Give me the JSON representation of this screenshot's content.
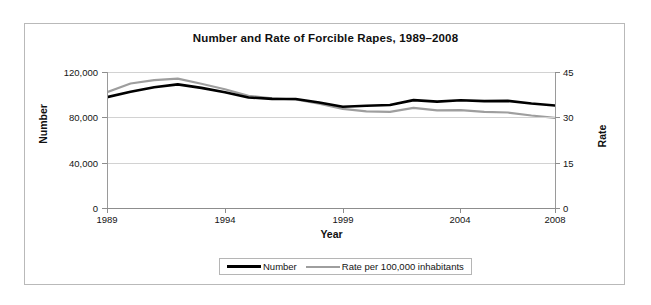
{
  "chart_data": {
    "type": "line",
    "title": "Number and Rate of Forcible Rapes, 1989–2008",
    "xlabel": "Year",
    "ylabel": "Number",
    "y2label": "Rate",
    "grid": true,
    "legend_position": "bottom",
    "x": [
      1989,
      1990,
      1991,
      1992,
      1993,
      1994,
      1995,
      1996,
      1997,
      1998,
      1999,
      2000,
      2001,
      2002,
      2003,
      2004,
      2005,
      2006,
      2007,
      2008
    ],
    "x_tick_labels": [
      "1989",
      "1994",
      "1999",
      "2004",
      "2008"
    ],
    "x_ticks": [
      1989,
      1994,
      1999,
      2004,
      2008
    ],
    "ylim": [
      0,
      120000
    ],
    "y_tick_labels": [
      "0",
      "40,000",
      "80,000",
      "120,000"
    ],
    "y_ticks": [
      0,
      40000,
      80000,
      120000
    ],
    "y2lim": [
      0,
      45
    ],
    "y2_tick_labels": [
      "0",
      "15",
      "30",
      "45"
    ],
    "y2_ticks": [
      0,
      15,
      30,
      45
    ],
    "series": [
      {
        "name": "Number",
        "axis": "left",
        "color": "#000000",
        "values": [
          97800,
          102600,
          106600,
          109100,
          106000,
          102200,
          97500,
          96300,
          96200,
          93100,
          89400,
          90200,
          90900,
          95200,
          93900,
          95100,
          94300,
          94500,
          92200,
          90500
        ]
      },
      {
        "name": "Rate per 100,000 inhabitants",
        "axis": "right",
        "color": "#9e9e9e",
        "values": [
          38.3,
          41.2,
          42.3,
          42.8,
          41.1,
          39.3,
          37.1,
          36.3,
          35.9,
          34.5,
          32.8,
          32.0,
          31.8,
          33.1,
          32.3,
          32.4,
          31.8,
          31.6,
          30.6,
          29.8
        ]
      }
    ]
  },
  "legend": {
    "entries": [
      {
        "label": "Number"
      },
      {
        "label": "Rate per 100,000 inhabitants"
      }
    ]
  },
  "colors": {
    "number_line": "#000000",
    "rate_line": "#9e9e9e",
    "grid": "#d2d2d2",
    "axis": "#8d8d8d",
    "frame": "#b9b9b9",
    "text": "#141414"
  }
}
